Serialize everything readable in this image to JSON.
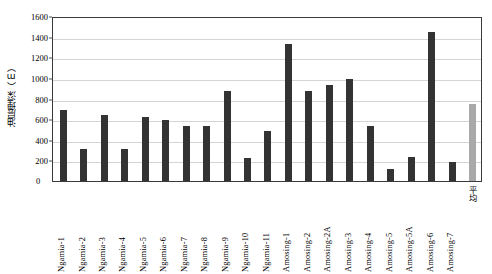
{
  "chart_data": {
    "type": "bar",
    "title": "",
    "xlabel": "",
    "ylabel": "油层埋深（m）",
    "ylim": [
      0,
      1600
    ],
    "ytick_step": 200,
    "yticks": [
      "0",
      "200",
      "400",
      "600",
      "800",
      "1000",
      "1200",
      "1400",
      "1600"
    ],
    "grid": true,
    "legend": "none",
    "bar_color": "#333333",
    "highlight_color": "#a9a9a9",
    "categories": [
      "Ngamia-1",
      "Ngamia-2",
      "Ngamia-3",
      "Ngamia-4",
      "Ngamia-5",
      "Ngamia-6",
      "Ngamia-7",
      "Ngamia-8",
      "Ngamia-9",
      "Ngamia-10",
      "Ngamia-11",
      "Amosing-1",
      "Amosing-2",
      "Amosing-2A",
      "Amosing-3",
      "Amosing-4",
      "Amosing-5",
      "Amosing-5A",
      "Amosing-6",
      "Amosing-7",
      "平均"
    ],
    "values": [
      690,
      315,
      645,
      310,
      625,
      590,
      530,
      535,
      870,
      225,
      490,
      1330,
      875,
      935,
      985,
      535,
      115,
      230,
      1450,
      180,
      745
    ],
    "series_name": "油层埋深"
  }
}
